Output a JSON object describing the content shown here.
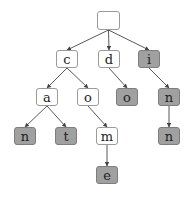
{
  "diagram": {
    "type": "trie",
    "colors": {
      "internal_fill": "#ffffff",
      "terminal_fill": "#a0a0a0",
      "edge": "#444444"
    },
    "nodes": [
      {
        "id": "root",
        "label": "",
        "terminal": false,
        "x": 97,
        "y": 11,
        "w": 23,
        "h": 19
      },
      {
        "id": "c",
        "label": "c",
        "terminal": false,
        "x": 56,
        "y": 50,
        "w": 22,
        "h": 18
      },
      {
        "id": "d",
        "label": "d",
        "terminal": false,
        "x": 98,
        "y": 50,
        "w": 22,
        "h": 18
      },
      {
        "id": "i",
        "label": "i",
        "terminal": true,
        "x": 138,
        "y": 50,
        "w": 22,
        "h": 18
      },
      {
        "id": "a",
        "label": "a",
        "terminal": false,
        "x": 36,
        "y": 88,
        "w": 22,
        "h": 18
      },
      {
        "id": "o1",
        "label": "o",
        "terminal": false,
        "x": 77,
        "y": 88,
        "w": 22,
        "h": 18
      },
      {
        "id": "o2",
        "label": "o",
        "terminal": true,
        "x": 116,
        "y": 88,
        "w": 22,
        "h": 18
      },
      {
        "id": "n1",
        "label": "n",
        "terminal": true,
        "x": 158,
        "y": 88,
        "w": 22,
        "h": 18
      },
      {
        "id": "n2",
        "label": "n",
        "terminal": true,
        "x": 14,
        "y": 127,
        "w": 22,
        "h": 18
      },
      {
        "id": "t",
        "label": "t",
        "terminal": true,
        "x": 55,
        "y": 127,
        "w": 22,
        "h": 18
      },
      {
        "id": "m",
        "label": "m",
        "terminal": false,
        "x": 96,
        "y": 127,
        "w": 22,
        "h": 18
      },
      {
        "id": "n3",
        "label": "n",
        "terminal": true,
        "x": 158,
        "y": 127,
        "w": 22,
        "h": 18
      },
      {
        "id": "e",
        "label": "e",
        "terminal": true,
        "x": 96,
        "y": 166,
        "w": 22,
        "h": 18
      }
    ],
    "edges": [
      [
        "root",
        "c"
      ],
      [
        "root",
        "d"
      ],
      [
        "root",
        "i"
      ],
      [
        "c",
        "a"
      ],
      [
        "c",
        "o1"
      ],
      [
        "d",
        "o2"
      ],
      [
        "i",
        "n1"
      ],
      [
        "a",
        "n2"
      ],
      [
        "a",
        "t"
      ],
      [
        "o1",
        "m"
      ],
      [
        "n1",
        "n3"
      ],
      [
        "m",
        "e"
      ]
    ],
    "words": [
      "can",
      "cat",
      "come",
      "do",
      "i",
      "in",
      "inn"
    ]
  }
}
